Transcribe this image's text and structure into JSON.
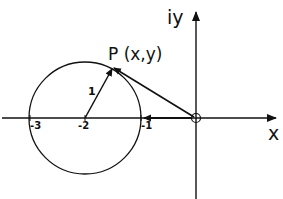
{
  "diagram": {
    "axes": {
      "x_label": "x",
      "y_label": "iy"
    },
    "ticks": [
      {
        "label": "-3",
        "value": -3
      },
      {
        "label": "-2",
        "value": -2
      },
      {
        "label": "-1",
        "value": -1
      }
    ],
    "circle": {
      "center": [
        -2,
        0
      ],
      "radius": 1,
      "radius_label": "1"
    },
    "point": {
      "label": "P (x,y)"
    },
    "origin": {
      "marker": "open-circle"
    },
    "colors": {
      "ink": "#111111",
      "background": "#ffffff"
    }
  }
}
